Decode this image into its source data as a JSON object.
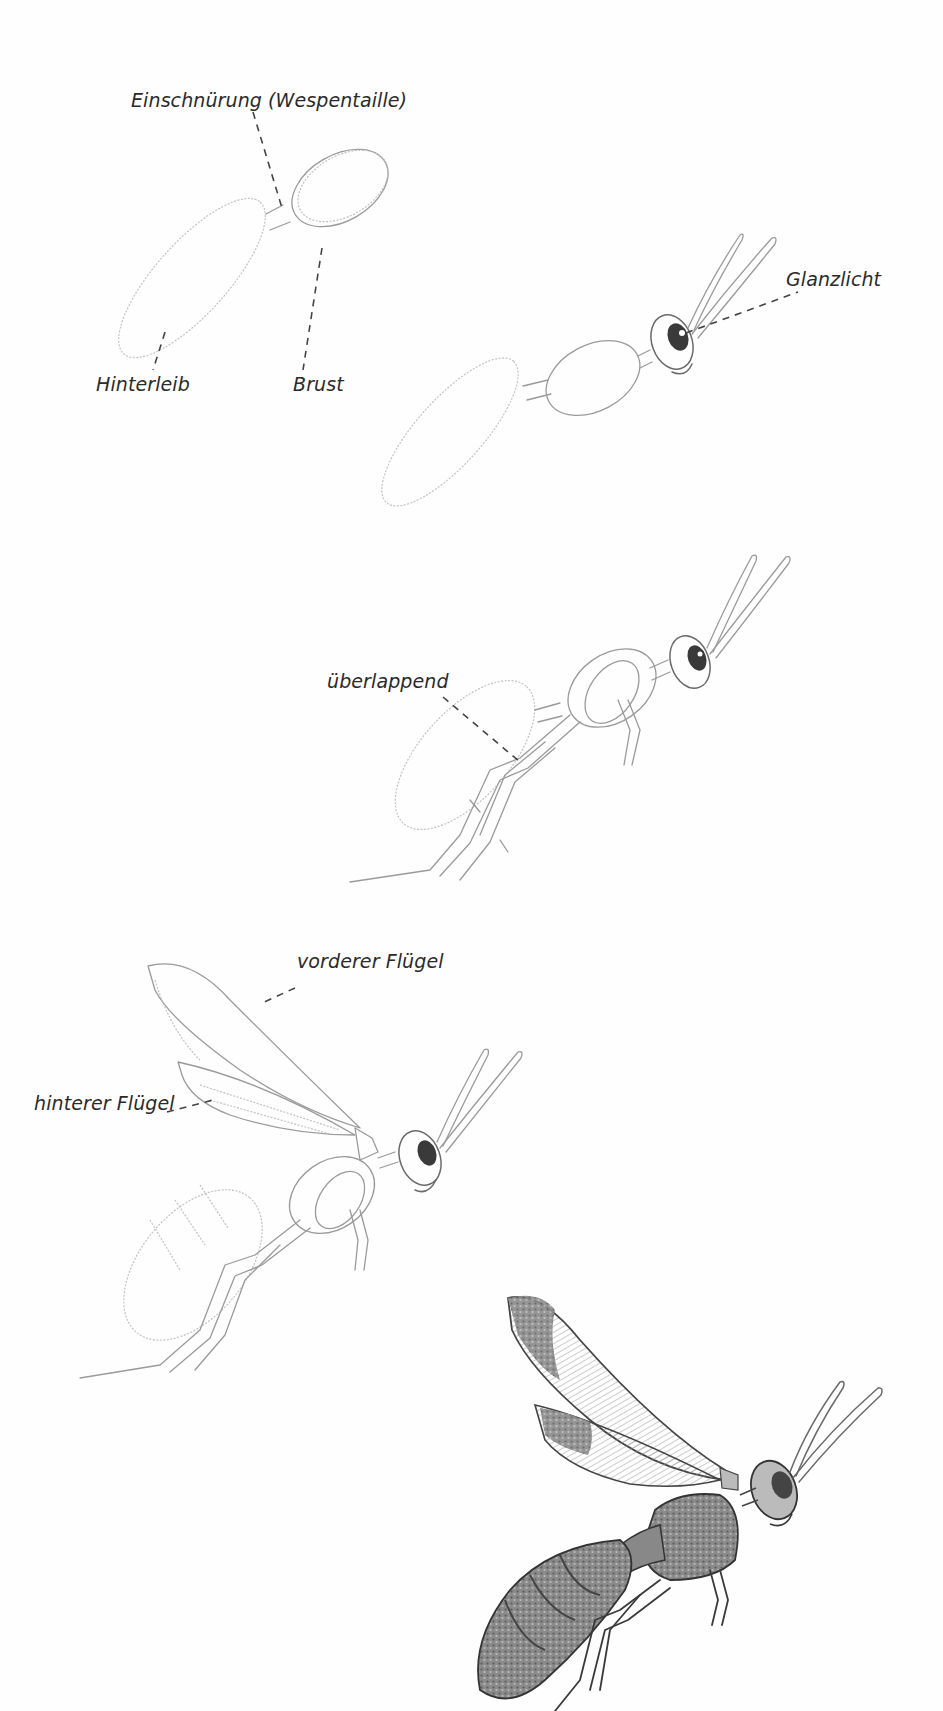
{
  "page": {
    "background": "#fefefe",
    "ink_color": "#2a2a2a",
    "sketch_color": "#9a9a9a"
  },
  "stages": [
    {
      "id": 1,
      "description": "basic body shapes",
      "labels": {
        "waist": "Einschnürung (Wespentaille)",
        "abdomen": "Hinterleib",
        "thorax": "Brust"
      }
    },
    {
      "id": 2,
      "description": "head and antennae added",
      "labels": {
        "highlight": "Glanzlicht"
      }
    },
    {
      "id": 3,
      "description": "legs added",
      "labels": {
        "overlap": "überlappend"
      }
    },
    {
      "id": 4,
      "description": "wings added",
      "labels": {
        "front_wing": "vorderer Flügel",
        "hind_wing": "hinterer Flügel"
      }
    },
    {
      "id": 5,
      "description": "finished shaded wasp",
      "labels": {}
    }
  ]
}
